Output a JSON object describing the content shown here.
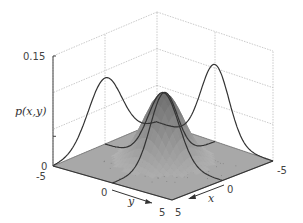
{
  "chart_data": {
    "type": "surface",
    "title": "",
    "zlabel": "p(x,y)",
    "xlabel": "x",
    "ylabel": "y",
    "xlim": [
      -5,
      5
    ],
    "ylim": [
      -5,
      5
    ],
    "zlim": [
      0,
      0.15
    ],
    "z_ticks": [
      "0",
      "0.15"
    ],
    "x_ticks": [
      "-5",
      "0",
      "5"
    ],
    "y_ticks": [
      "-5",
      "0",
      "5"
    ],
    "distribution": {
      "kind": "bivariate-gaussian",
      "mean": [
        0,
        0
      ],
      "sigma_x": 1.3,
      "sigma_y": 1.3,
      "peak_density": 0.095
    },
    "marginals": [
      {
        "name": "marginal-p(y)",
        "projected_on": "x=-5 wall",
        "peak": 0.105
      },
      {
        "name": "marginal-p(x)",
        "projected_on": "y=-5 wall",
        "peak": 0.09
      }
    ],
    "samples_scattered": true,
    "grid": true,
    "colors": {
      "surface": "#8a8a8a",
      "floor": "#a8a8a8",
      "curve": "#333333",
      "grid": "#bdbdbd"
    }
  }
}
